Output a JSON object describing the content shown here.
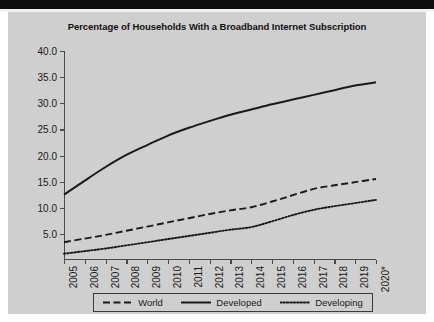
{
  "chart_data": {
    "type": "line",
    "title": "Percentage of Households With a Broadband Internet Subscription",
    "xlabel": "",
    "ylabel": "",
    "grid": false,
    "legend_position": "bottom",
    "x": [
      "2005",
      "2006",
      "2007",
      "2008",
      "2009",
      "2010",
      "2011",
      "2012",
      "2013",
      "2014",
      "2015",
      "2016",
      "2017",
      "2018",
      "2019",
      "2020*"
    ],
    "categories": [
      "2005",
      "2006",
      "2007",
      "2008",
      "2009",
      "2010",
      "2011",
      "2012",
      "2013",
      "2014",
      "2015",
      "2016",
      "2017",
      "2018",
      "2019",
      "2020*"
    ],
    "ylim": [
      0.0,
      40.0
    ],
    "yticks": [
      5.0,
      10.0,
      15.0,
      20.0,
      25.0,
      30.0,
      35.0,
      40.0
    ],
    "ytick_labels": [
      "5.0",
      "10.0",
      "15.0",
      "20.0",
      "25.0",
      "30.0",
      "35.0",
      "40.0"
    ],
    "series": [
      {
        "name": "World",
        "style": "dashed",
        "color": "#1a1a1a",
        "values": [
          3.4,
          4.1,
          4.8,
          5.6,
          6.4,
          7.2,
          8.0,
          8.8,
          9.5,
          10.1,
          11.2,
          12.4,
          13.6,
          14.3,
          14.9,
          15.5
        ]
      },
      {
        "name": "Developed",
        "style": "solid",
        "color": "#1a1a1a",
        "values": [
          12.5,
          15.2,
          17.8,
          20.1,
          22.0,
          23.8,
          25.3,
          26.6,
          27.8,
          28.8,
          29.8,
          30.7,
          31.6,
          32.5,
          33.4,
          34.0
        ]
      },
      {
        "name": "Developing",
        "style": "dotted",
        "color": "#1a1a1a",
        "values": [
          1.2,
          1.7,
          2.2,
          2.8,
          3.4,
          4.0,
          4.6,
          5.2,
          5.8,
          6.3,
          7.4,
          8.6,
          9.6,
          10.3,
          10.9,
          11.5
        ]
      }
    ]
  },
  "legend": {
    "entries": [
      {
        "label": "World",
        "style": "dashed"
      },
      {
        "label": "Developed",
        "style": "solid"
      },
      {
        "label": "Developing",
        "style": "dotted"
      }
    ]
  },
  "colors": {
    "panel_background": "#cfcfcf",
    "line": "#1a1a1a",
    "axis": "#4a4a4a",
    "top_band": "#0d0d0d"
  }
}
